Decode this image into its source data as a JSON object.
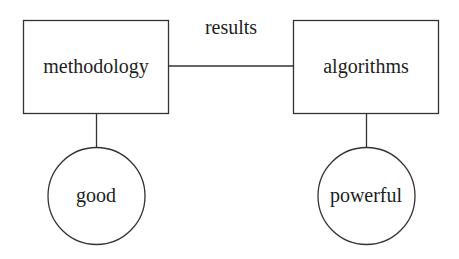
{
  "diagram": {
    "type": "entity-relationship",
    "nodes": [
      {
        "id": "methodology",
        "label": "methodology",
        "shape": "rectangle"
      },
      {
        "id": "algorithms",
        "label": "algorithms",
        "shape": "rectangle"
      },
      {
        "id": "good",
        "label": "good",
        "shape": "circle"
      },
      {
        "id": "powerful",
        "label": "powerful",
        "shape": "circle"
      }
    ],
    "edges": [
      {
        "from": "methodology",
        "to": "algorithms",
        "label": "results"
      },
      {
        "from": "methodology",
        "to": "good",
        "label": ""
      },
      {
        "from": "algorithms",
        "to": "powerful",
        "label": ""
      }
    ],
    "colors": {
      "stroke": "#333333",
      "text": "#1e1e1e",
      "background": "#ffffff"
    }
  }
}
